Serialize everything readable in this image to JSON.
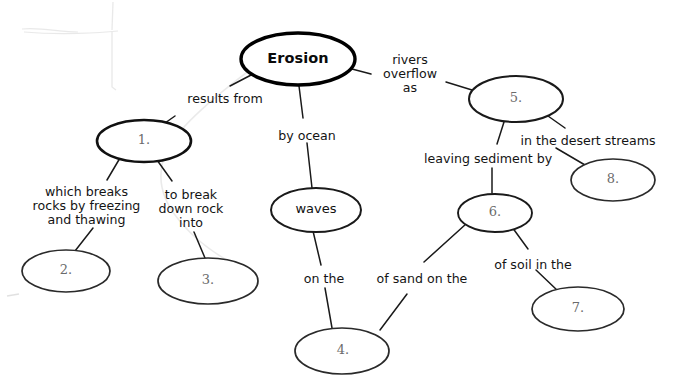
{
  "diagram": {
    "title_node": "Erosion",
    "type": "concept-map",
    "stroke_color": "#1a1a1a",
    "root_stroke_color": "#000000",
    "numbered_text_color": "#6b6b6b",
    "pencil_mark_color": "#b9b9b9"
  },
  "nodes": [
    {
      "id": "erosion",
      "label": "Erosion",
      "kind": "root",
      "cx": 298,
      "cy": 59,
      "rx": 57,
      "ry": 26
    },
    {
      "id": "n1",
      "label": "1.",
      "kind": "blank",
      "cx": 144,
      "cy": 141,
      "rx": 47,
      "ry": 21
    },
    {
      "id": "n2",
      "label": "2.",
      "kind": "blank",
      "cx": 66,
      "cy": 271,
      "rx": 44,
      "ry": 21
    },
    {
      "id": "n3",
      "label": "3.",
      "kind": "blank",
      "cx": 208,
      "cy": 281,
      "rx": 50,
      "ry": 23
    },
    {
      "id": "waves",
      "label": "waves",
      "kind": "named",
      "cx": 316,
      "cy": 210,
      "rx": 45,
      "ry": 22
    },
    {
      "id": "n4",
      "label": "4.",
      "kind": "blank",
      "cx": 342,
      "cy": 351,
      "rx": 47,
      "ry": 23
    },
    {
      "id": "n5",
      "label": "5.",
      "kind": "blank",
      "cx": 516,
      "cy": 99,
      "rx": 47,
      "ry": 23
    },
    {
      "id": "n6",
      "label": "6.",
      "kind": "blank",
      "cx": 495,
      "cy": 213,
      "rx": 37,
      "ry": 19
    },
    {
      "id": "n7",
      "label": "7.",
      "kind": "blank",
      "cx": 578,
      "cy": 309,
      "rx": 46,
      "ry": 22
    },
    {
      "id": "n8",
      "label": "8.",
      "kind": "blank",
      "cx": 613,
      "cy": 180,
      "rx": 42,
      "ry": 21
    }
  ],
  "links": [
    {
      "id": "l-erosion-n1",
      "label": "results from",
      "from": "erosion",
      "to": "n1",
      "x": 181,
      "y": 92,
      "w": 88,
      "align": "center"
    },
    {
      "id": "l-erosion-waves",
      "label": "by ocean",
      "from": "erosion",
      "to": "waves",
      "x": 276,
      "y": 129,
      "w": 62,
      "align": "center"
    },
    {
      "id": "l-erosion-n5",
      "label": "rivers\noverflow\nas",
      "from": "erosion",
      "to": "n5",
      "x": 377,
      "y": 53,
      "w": 66,
      "align": "center"
    },
    {
      "id": "l-n1-n2",
      "label": "which breaks\nrocks by freezing\nand thawing",
      "from": "n1",
      "to": "n2",
      "x": 21,
      "y": 185,
      "w": 131,
      "align": "center"
    },
    {
      "id": "l-n1-n3",
      "label": "to break\ndown rock\ninto",
      "from": "n1",
      "to": "n3",
      "x": 155,
      "y": 188,
      "w": 72,
      "align": "center"
    },
    {
      "id": "l-waves-n4",
      "label": "on the",
      "from": "waves",
      "to": "n4",
      "x": 301,
      "y": 272,
      "w": 46,
      "align": "center"
    },
    {
      "id": "l-n6-n4",
      "label": "of sand on the",
      "from": "n6",
      "to": "n4",
      "x": 374,
      "y": 272,
      "w": 96,
      "align": "center"
    },
    {
      "id": "l-n5-n6",
      "label": "leaving sediment by",
      "from": "n5",
      "to": "n6",
      "x": 424,
      "y": 152,
      "w": 128,
      "align": "center"
    },
    {
      "id": "l-n5-n8",
      "label": "in the desert streams",
      "from": "n5",
      "to": "n8",
      "x": 518,
      "y": 134,
      "w": 140,
      "align": "center"
    },
    {
      "id": "l-n6-n7",
      "label": "of soil in the",
      "from": "n6",
      "to": "n7",
      "x": 490,
      "y": 258,
      "w": 86,
      "align": "center"
    }
  ]
}
